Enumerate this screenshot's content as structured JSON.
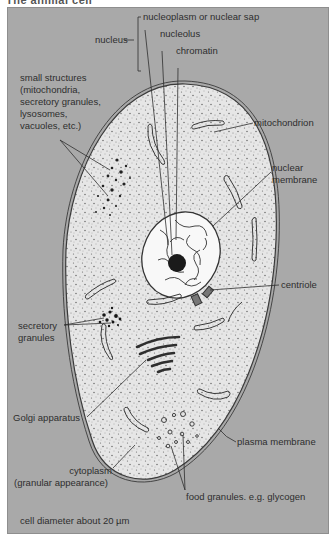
{
  "title": "The animal cell",
  "colors": {
    "background": "#a9a9a9",
    "cytoplasm": "#e6e6e6",
    "nucleus_fill": "#f6f6f6",
    "outline": "#3a3a3a",
    "label_text": "#2e2e2e"
  },
  "labels": {
    "nucleus": "nucleus",
    "nucleoplasm": "nucleoplasm or nuclear sap",
    "nucleolus": "nucleolus",
    "chromatin": "chromatin",
    "small_structures": [
      "small structures",
      "(mitochondria,",
      "secretory granules,",
      "lysosomes,",
      "vacuoles, etc.)"
    ],
    "mitochondrion": "mitochondrion",
    "nuclear_membrane": [
      "nuclear",
      "membrane"
    ],
    "centriole": "centriole",
    "secretory_granules": [
      "secretory",
      "granules"
    ],
    "golgi": "Golgi apparatus",
    "plasma_membrane": "plasma membrane",
    "cytoplasm": [
      "cytoplasm",
      "(granular appearance)"
    ],
    "food_granules": "food granules. e.g. glycogen",
    "scale": "cell diameter about 20 µm"
  }
}
